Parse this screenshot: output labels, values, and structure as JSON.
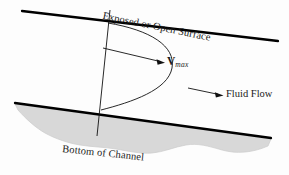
{
  "figure": {
    "background_color": "#fdfdfd"
  },
  "labels": {
    "exposed_surface": "Exposed or Open Surface",
    "bottom_channel": "Bottom of Channel",
    "fluid_flow": "Fluid Flow",
    "vmax_symbol": "V",
    "vmax_subscript": "max"
  },
  "colors": {
    "line": "#000000",
    "text": "#1a1a1a",
    "channel_bed_fill": "#d8d8d8",
    "channel_bed_edge": "#c9c9c9"
  },
  "geometry": {
    "surface_line": {
      "x1": 22,
      "y1": 11,
      "x2": 278,
      "y2": 41
    },
    "bottom_line": {
      "x1": 15,
      "y1": 103,
      "x2": 271,
      "y2": 138
    },
    "vertical_reference_line": {
      "x1": 110,
      "y1": 10,
      "x2": 97,
      "y2": 136
    },
    "vmax_arrow": {
      "x1": 103,
      "y1": 48,
      "x2": 164,
      "y2": 62
    },
    "fluid_flow_arrow": {
      "x1": 188,
      "y1": 88,
      "x2": 223,
      "y2": 95
    },
    "velocity_profile": {
      "start": {
        "x": 108,
        "y": 23
      },
      "max": {
        "x": 166,
        "y": 62
      },
      "end": {
        "x": 101,
        "y": 110
      }
    }
  }
}
